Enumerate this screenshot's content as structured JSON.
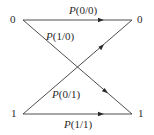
{
  "diagram": {
    "type": "binary-channel-transition",
    "colors": {
      "line": "#3a3a3a",
      "text": "#2a2a2a",
      "background": "#ffffff"
    },
    "inputs": [
      {
        "id": "in0",
        "label": "0"
      },
      {
        "id": "in1",
        "label": "1"
      }
    ],
    "outputs": [
      {
        "id": "out0",
        "label": "0"
      },
      {
        "id": "out1",
        "label": "1"
      }
    ],
    "edges": [
      {
        "from": "in0",
        "to": "out0",
        "symbol": "P",
        "args": "(0/0)"
      },
      {
        "from": "in0",
        "to": "out1",
        "symbol": "P",
        "args": "(1/0)"
      },
      {
        "from": "in1",
        "to": "out0",
        "symbol": "P",
        "args": "(0/1)"
      },
      {
        "from": "in1",
        "to": "out1",
        "symbol": "P",
        "args": "(1/1)"
      }
    ]
  }
}
